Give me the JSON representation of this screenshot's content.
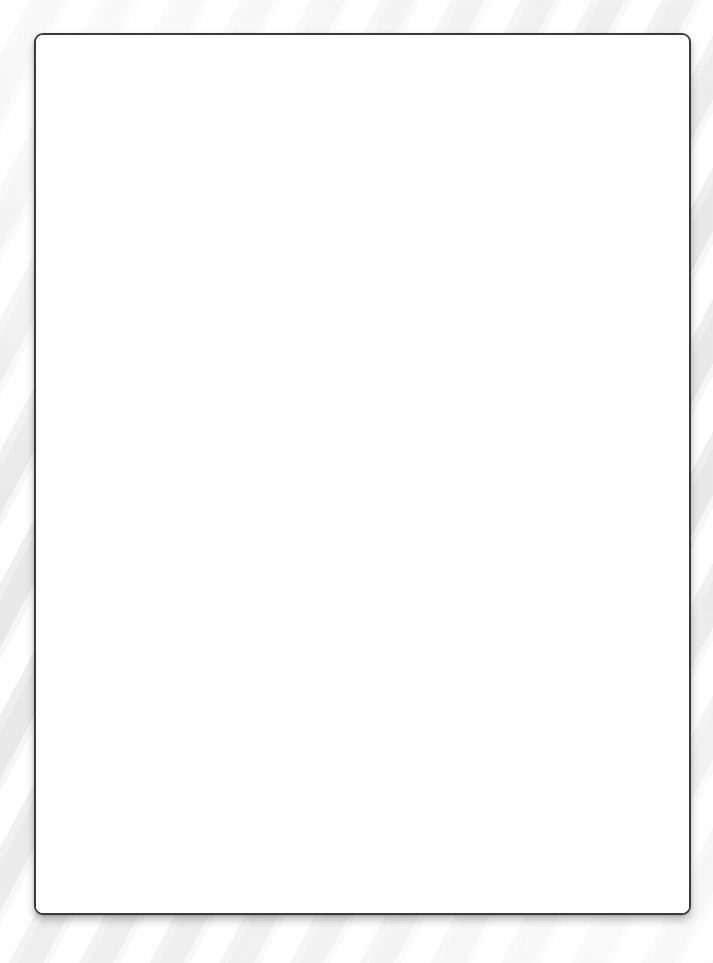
{
  "page": {
    "width": 713,
    "height": 963,
    "background_style": "diagonal-stripes",
    "background_colors": {
      "stripe_light": "#ffffff",
      "stripe_shade": "#e9e9e9",
      "base": "#fdfdfd"
    }
  },
  "card": {
    "label": "blank-document",
    "content_text": "",
    "is_empty": true,
    "border_color": "#3b3b3d",
    "fill_color": "#ffffff",
    "border_width_px": 2,
    "corner_radius_px": 9,
    "bounds": {
      "left": 34,
      "top": 33,
      "width": 657,
      "height": 882
    }
  }
}
